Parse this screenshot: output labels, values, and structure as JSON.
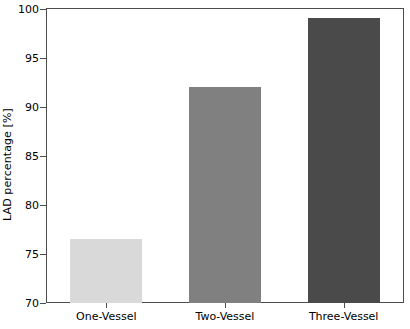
{
  "chart_data": {
    "type": "bar",
    "title": "",
    "xlabel": "",
    "ylabel": "LAD percentage [%]",
    "categories": [
      "One-Vessel",
      "Two-Vessel",
      "Three-Vessel"
    ],
    "values": [
      76.5,
      92.0,
      99.1
    ],
    "ylim": [
      70,
      100
    ],
    "yticks": [
      70,
      75,
      80,
      85,
      90,
      95,
      100
    ],
    "ytick_labels": [
      "70",
      "75",
      "80",
      "85",
      "90",
      "95",
      "100"
    ],
    "grid": false,
    "legend": false,
    "legend_position": "none",
    "bar_colors": [
      "#d9d9d9",
      "#808080",
      "#4a4a4a"
    ],
    "frame_color": "#4d4d4d",
    "background_color": "#ffffff",
    "text_color": "#000000"
  }
}
